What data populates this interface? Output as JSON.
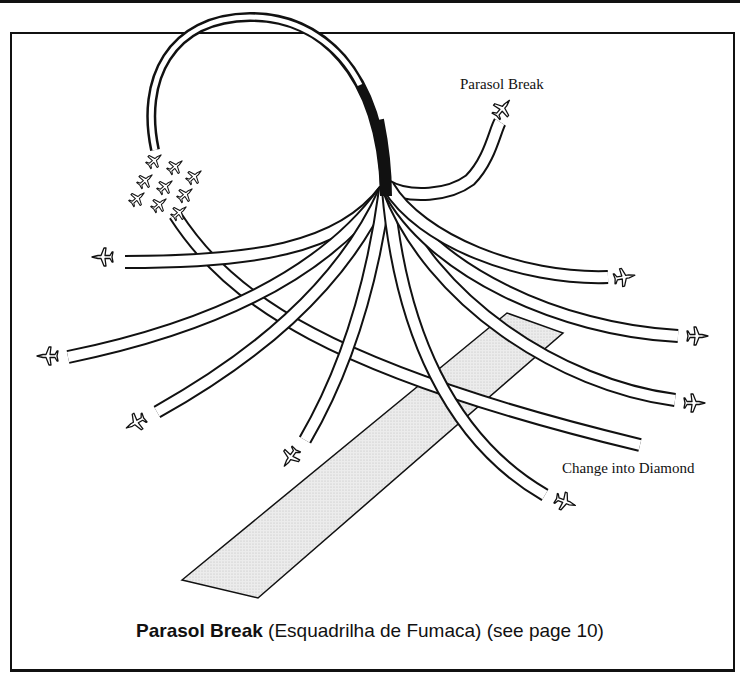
{
  "diagram": {
    "title": "Parasol Break",
    "caption": {
      "bold": "Parasol Break",
      "rest": " (Esquadrilha de Fumaca) (see page 10)"
    },
    "labels": {
      "parasol_break": "Parasol Break",
      "change_into_diamond": "Change into Diamond"
    },
    "elements": {
      "formation": "9-aircraft formation (plane icons)",
      "loop": "smoke-trail loop converging to a single point",
      "trails_count": 10,
      "runway": "shaded runway strip"
    },
    "colors": {
      "ink": "#111111",
      "runway_fill": "#e6e6e6",
      "background": "#ffffff"
    }
  }
}
